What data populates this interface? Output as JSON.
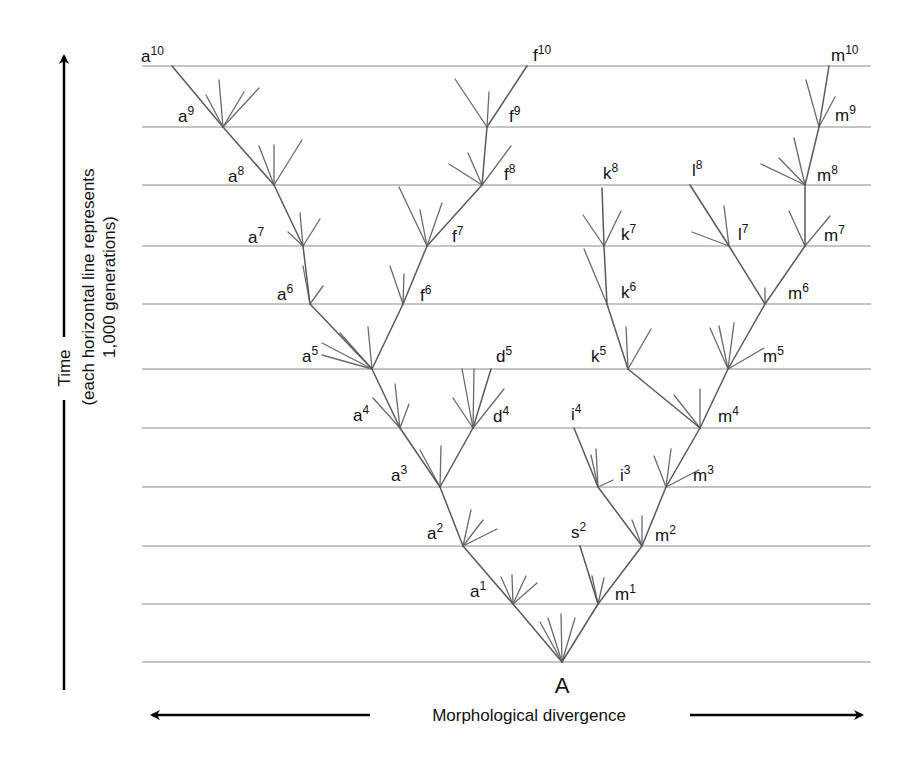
{
  "diagram": {
    "root_label": "A",
    "x_axis_label": "Morphological divergence",
    "y_axis_label_main": "Time",
    "y_axis_label_sub1": "(each horizontal line represents",
    "y_axis_label_sub2": "1,000 generations)",
    "colors": {
      "lines": "#8a8a8a",
      "branches": "#5a5a5a",
      "text": "#111111",
      "axis": "#000000"
    },
    "generation_lines": {
      "x_start": 142,
      "x_end": 871,
      "y": [
        662,
        604,
        546,
        487,
        428,
        369,
        304,
        246,
        185,
        127,
        66
      ]
    },
    "nodes": [
      {
        "id": "A",
        "letter": "A",
        "gen": "",
        "x": 562,
        "y": 662
      },
      {
        "id": "a1",
        "letter": "a",
        "gen": "1",
        "x": 513,
        "y": 604,
        "lx": 470,
        "ly": 597
      },
      {
        "id": "m1",
        "letter": "m",
        "gen": "1",
        "x": 598,
        "y": 604,
        "lx": 615,
        "ly": 600
      },
      {
        "id": "a2",
        "letter": "a",
        "gen": "2",
        "x": 463,
        "y": 546,
        "lx": 427,
        "ly": 539
      },
      {
        "id": "m2",
        "letter": "m",
        "gen": "2",
        "x": 642,
        "y": 546,
        "lx": 655,
        "ly": 541
      },
      {
        "id": "s2",
        "letter": "s",
        "gen": "2",
        "x": 580,
        "y": 546,
        "lx": 571,
        "ly": 538
      },
      {
        "id": "a3",
        "letter": "a",
        "gen": "3",
        "x": 440,
        "y": 487,
        "lx": 391,
        "ly": 481
      },
      {
        "id": "i3",
        "letter": "i",
        "gen": "3",
        "x": 598,
        "y": 487,
        "lx": 620,
        "ly": 481
      },
      {
        "id": "m3",
        "letter": "m",
        "gen": "3",
        "x": 666,
        "y": 487,
        "lx": 693,
        "ly": 481
      },
      {
        "id": "a4",
        "letter": "a",
        "gen": "4",
        "x": 400,
        "y": 428,
        "lx": 353,
        "ly": 421
      },
      {
        "id": "d4",
        "letter": "d",
        "gen": "4",
        "x": 473,
        "y": 428,
        "lx": 493,
        "ly": 422
      },
      {
        "id": "i4",
        "letter": "i",
        "gen": "4",
        "x": 574,
        "y": 428,
        "lx": 571,
        "ly": 420
      },
      {
        "id": "m4",
        "letter": "m",
        "gen": "4",
        "x": 700,
        "y": 428,
        "lx": 718,
        "ly": 422
      },
      {
        "id": "a5",
        "letter": "a",
        "gen": "5",
        "x": 372,
        "y": 369,
        "lx": 302,
        "ly": 362
      },
      {
        "id": "d5",
        "letter": "d",
        "gen": "5",
        "x": 491,
        "y": 369,
        "lx": 496,
        "ly": 362
      },
      {
        "id": "k5",
        "letter": "k",
        "gen": "5",
        "x": 628,
        "y": 369,
        "lx": 591,
        "ly": 362
      },
      {
        "id": "m5",
        "letter": "m",
        "gen": "5",
        "x": 728,
        "y": 369,
        "lx": 763,
        "ly": 362
      },
      {
        "id": "a6",
        "letter": "a",
        "gen": "6",
        "x": 310,
        "y": 304,
        "lx": 277,
        "ly": 300
      },
      {
        "id": "f6",
        "letter": "f",
        "gen": "6",
        "x": 403,
        "y": 304,
        "lx": 420,
        "ly": 301
      },
      {
        "id": "k6",
        "letter": "k",
        "gen": "6",
        "x": 607,
        "y": 304,
        "lx": 621,
        "ly": 298
      },
      {
        "id": "m6",
        "letter": "m",
        "gen": "6",
        "x": 765,
        "y": 304,
        "lx": 788,
        "ly": 299
      },
      {
        "id": "a7",
        "letter": "a",
        "gen": "7",
        "x": 303,
        "y": 246,
        "lx": 248,
        "ly": 243
      },
      {
        "id": "f7",
        "letter": "f",
        "gen": "7",
        "x": 427,
        "y": 246,
        "lx": 452,
        "ly": 242
      },
      {
        "id": "k7",
        "letter": "k",
        "gen": "7",
        "x": 604,
        "y": 246,
        "lx": 621,
        "ly": 240
      },
      {
        "id": "l7",
        "letter": "l",
        "gen": "7",
        "x": 729,
        "y": 246,
        "lx": 738,
        "ly": 240
      },
      {
        "id": "m7",
        "letter": "m",
        "gen": "7",
        "x": 805,
        "y": 246,
        "lx": 824,
        "ly": 241
      },
      {
        "id": "a8",
        "letter": "a",
        "gen": "8",
        "x": 274,
        "y": 185,
        "lx": 228,
        "ly": 182
      },
      {
        "id": "f8",
        "letter": "f",
        "gen": "8",
        "x": 482,
        "y": 185,
        "lx": 504,
        "ly": 180
      },
      {
        "id": "k8",
        "letter": "k",
        "gen": "8",
        "x": 602,
        "y": 188,
        "lx": 603,
        "ly": 179
      },
      {
        "id": "l8",
        "letter": "l",
        "gen": "8",
        "x": 690,
        "y": 185,
        "lx": 692,
        "ly": 176
      },
      {
        "id": "m8",
        "letter": "m",
        "gen": "8",
        "x": 805,
        "y": 185,
        "lx": 817,
        "ly": 181
      },
      {
        "id": "a9",
        "letter": "a",
        "gen": "9",
        "x": 223,
        "y": 127,
        "lx": 178,
        "ly": 122
      },
      {
        "id": "f9",
        "letter": "f",
        "gen": "9",
        "x": 487,
        "y": 127,
        "lx": 509,
        "ly": 122
      },
      {
        "id": "m9",
        "letter": "m",
        "gen": "9",
        "x": 819,
        "y": 127,
        "lx": 835,
        "ly": 121
      },
      {
        "id": "a10",
        "letter": "a",
        "gen": "10",
        "x": 172,
        "y": 66,
        "lx": 141,
        "ly": 62
      },
      {
        "id": "f10",
        "letter": "f",
        "gen": "10",
        "x": 527,
        "y": 66,
        "lx": 533,
        "ly": 61
      },
      {
        "id": "m10",
        "letter": "m",
        "gen": "10",
        "x": 829,
        "y": 66,
        "lx": 831,
        "ly": 61
      }
    ],
    "edges": [
      [
        "A",
        "a1"
      ],
      [
        "A",
        "m1"
      ],
      [
        "a1",
        "a2"
      ],
      [
        "m1",
        "s2"
      ],
      [
        "m1",
        "m2"
      ],
      [
        "a2",
        "a3"
      ],
      [
        "m2",
        "i3"
      ],
      [
        "m2",
        "m3"
      ],
      [
        "a3",
        "a4"
      ],
      [
        "a3",
        "d4"
      ],
      [
        "i3",
        "i4"
      ],
      [
        "m3",
        "m4"
      ],
      [
        "a4",
        "a5"
      ],
      [
        "d4",
        "d5"
      ],
      [
        "m4",
        "k5"
      ],
      [
        "m4",
        "m5"
      ],
      [
        "a5",
        "a6"
      ],
      [
        "a5",
        "f6"
      ],
      [
        "k5",
        "k6"
      ],
      [
        "m5",
        "m6"
      ],
      [
        "a6",
        "a7"
      ],
      [
        "f6",
        "f7"
      ],
      [
        "k6",
        "k7"
      ],
      [
        "m6",
        "l7"
      ],
      [
        "m6",
        "m7"
      ],
      [
        "a7",
        "a8"
      ],
      [
        "f7",
        "f8"
      ],
      [
        "k7",
        "k8"
      ],
      [
        "l7",
        "l8"
      ],
      [
        "m7",
        "m8"
      ],
      [
        "a8",
        "a9"
      ],
      [
        "f8",
        "f9"
      ],
      [
        "m8",
        "m9"
      ],
      [
        "a9",
        "a10"
      ],
      [
        "f9",
        "f10"
      ],
      [
        "m9",
        "m10"
      ]
    ],
    "twigs": [
      [
        562,
        662,
        540,
        622
      ],
      [
        562,
        662,
        548,
        618
      ],
      [
        562,
        662,
        561,
        614
      ],
      [
        562,
        662,
        575,
        618
      ],
      [
        513,
        604,
        501,
        577
      ],
      [
        513,
        604,
        512,
        575
      ],
      [
        513,
        604,
        526,
        576
      ],
      [
        513,
        604,
        537,
        583
      ],
      [
        598,
        604,
        592,
        576
      ],
      [
        598,
        604,
        604,
        578
      ],
      [
        463,
        546,
        471,
        510
      ],
      [
        463,
        546,
        483,
        520
      ],
      [
        463,
        546,
        497,
        529
      ],
      [
        642,
        546,
        632,
        520
      ],
      [
        642,
        546,
        642,
        516
      ],
      [
        440,
        487,
        420,
        450
      ],
      [
        440,
        487,
        441,
        446
      ],
      [
        598,
        487,
        591,
        455
      ],
      [
        598,
        487,
        596,
        449
      ],
      [
        598,
        487,
        613,
        480
      ],
      [
        666,
        487,
        654,
        456
      ],
      [
        666,
        487,
        671,
        449
      ],
      [
        666,
        487,
        699,
        470
      ],
      [
        400,
        428,
        373,
        398
      ],
      [
        400,
        428,
        395,
        384
      ],
      [
        400,
        428,
        409,
        404
      ],
      [
        473,
        428,
        453,
        398
      ],
      [
        473,
        428,
        462,
        369
      ],
      [
        473,
        428,
        474,
        369
      ],
      [
        473,
        428,
        504,
        389
      ],
      [
        700,
        428,
        674,
        395
      ],
      [
        700,
        428,
        700,
        389
      ],
      [
        372,
        369,
        322,
        355
      ],
      [
        372,
        369,
        322,
        343
      ],
      [
        372,
        369,
        340,
        333
      ],
      [
        372,
        369,
        368,
        327
      ],
      [
        628,
        369,
        626,
        327
      ],
      [
        628,
        369,
        651,
        329
      ],
      [
        728,
        369,
        710,
        328
      ],
      [
        728,
        369,
        719,
        326
      ],
      [
        728,
        369,
        734,
        323
      ],
      [
        728,
        369,
        764,
        348
      ],
      [
        310,
        304,
        303,
        266
      ],
      [
        310,
        304,
        323,
        286
      ],
      [
        403,
        304,
        390,
        266
      ],
      [
        403,
        304,
        404,
        274
      ],
      [
        607,
        304,
        584,
        249
      ],
      [
        765,
        304,
        765,
        288
      ],
      [
        303,
        246,
        288,
        232
      ],
      [
        303,
        246,
        300,
        213
      ],
      [
        303,
        246,
        320,
        219
      ],
      [
        427,
        246,
        399,
        187
      ],
      [
        427,
        246,
        420,
        210
      ],
      [
        427,
        246,
        442,
        203
      ],
      [
        604,
        246,
        583,
        215
      ],
      [
        604,
        246,
        621,
        211
      ],
      [
        729,
        246,
        692,
        232
      ],
      [
        729,
        246,
        724,
        206
      ],
      [
        805,
        246,
        789,
        211
      ],
      [
        805,
        246,
        830,
        216
      ],
      [
        274,
        185,
        259,
        146
      ],
      [
        274,
        185,
        274,
        145
      ],
      [
        274,
        185,
        302,
        140
      ],
      [
        482,
        185,
        449,
        164
      ],
      [
        482,
        185,
        468,
        153
      ],
      [
        482,
        185,
        511,
        146
      ],
      [
        805,
        185,
        761,
        164
      ],
      [
        805,
        185,
        779,
        158
      ],
      [
        805,
        185,
        794,
        138
      ],
      [
        223,
        127,
        206,
        95
      ],
      [
        223,
        127,
        219,
        80
      ],
      [
        223,
        127,
        244,
        92
      ],
      [
        223,
        127,
        259,
        88
      ],
      [
        487,
        127,
        455,
        79
      ],
      [
        487,
        127,
        489,
        92
      ],
      [
        819,
        127,
        806,
        80
      ],
      [
        819,
        127,
        835,
        97
      ]
    ]
  }
}
